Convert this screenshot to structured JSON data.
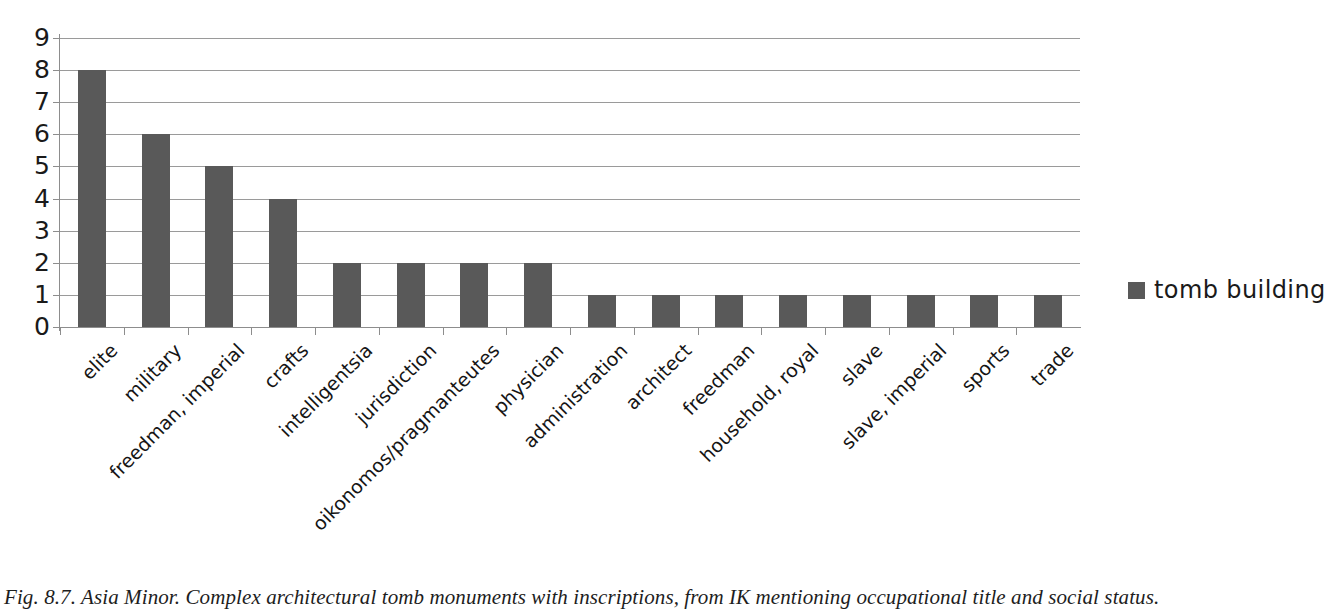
{
  "figure": {
    "caption": "Fig. 8.7. Asia Minor. Complex architectural tomb monuments with inscriptions, from IK mentioning occupational title and social status."
  },
  "legend": {
    "entries": [
      {
        "label": "tomb building",
        "color": "#595959"
      }
    ],
    "position": "right"
  },
  "colors": {
    "bar": "#595959",
    "gridline": "#9a9a9a",
    "axis": "#8d8d8d",
    "text": "#1a1a1a",
    "background": "#ffffff"
  },
  "chart_data": {
    "type": "bar",
    "title": "",
    "subtitle": "",
    "xlabel": "",
    "ylabel": "",
    "ylim": [
      0,
      9
    ],
    "ytick_labels": [
      "9",
      "8",
      "7",
      "6",
      "5",
      "4",
      "3",
      "2",
      "1",
      "0"
    ],
    "yticks": [
      9,
      8,
      7,
      6,
      5,
      4,
      3,
      2,
      1,
      0
    ],
    "grid": true,
    "legend_position": "right",
    "categories": [
      "elite",
      "military",
      "freedman, imperial",
      "crafts",
      "intelligentsia",
      "jurisdiction",
      "oikonomos/pragmanteutes",
      "physician",
      "administration",
      "architect",
      "freedman",
      "household, royal",
      "slave",
      "slave, imperial",
      "sports",
      "trade"
    ],
    "series": [
      {
        "name": "tomb building",
        "color": "#595959",
        "values": [
          8,
          6,
          5,
          4,
          2,
          2,
          2,
          2,
          1,
          1,
          1,
          1,
          1,
          1,
          1,
          1
        ]
      }
    ]
  }
}
